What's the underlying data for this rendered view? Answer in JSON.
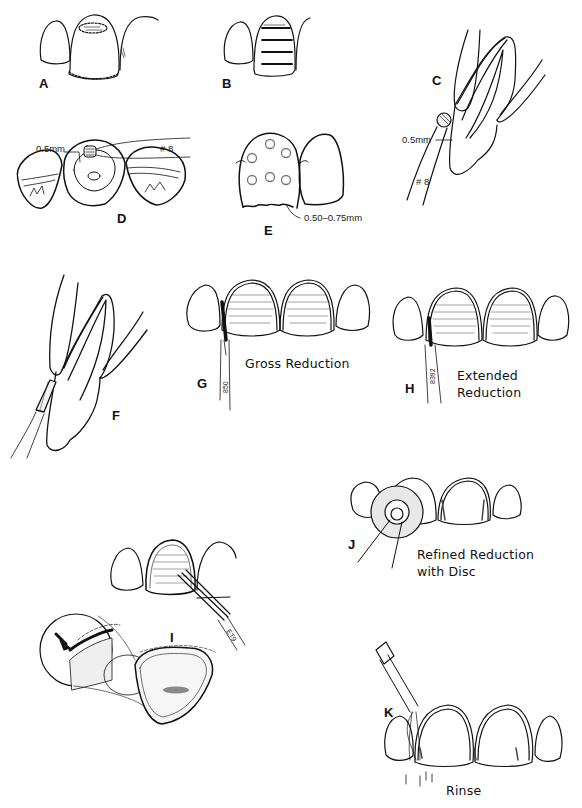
{
  "figure": {
    "panels": [
      {
        "id": "A",
        "label": "A"
      },
      {
        "id": "B",
        "label": "B"
      },
      {
        "id": "C",
        "label": "C",
        "measurement": "0.5mm",
        "instrument": "# 8"
      },
      {
        "id": "D",
        "label": "D",
        "measurement": "0.5mm",
        "instrument": "# 8"
      },
      {
        "id": "E",
        "label": "E",
        "measurement": "0.50–0.75mm"
      },
      {
        "id": "F",
        "label": "F"
      },
      {
        "id": "G",
        "label": "G",
        "caption": "Gross Reduction",
        "bur_number": "850"
      },
      {
        "id": "H",
        "label": "H",
        "caption": "Extended Reduction",
        "bur_number": "8392"
      },
      {
        "id": "I",
        "label": "I",
        "bur_number": "ET9"
      },
      {
        "id": "J",
        "label": "J",
        "caption_line1": "Refined Reduction",
        "caption_line2": "with Disc"
      },
      {
        "id": "K",
        "label": "K",
        "caption": "Rinse"
      }
    ]
  }
}
